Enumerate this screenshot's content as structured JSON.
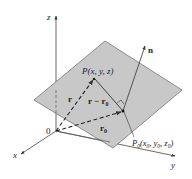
{
  "diagram": {
    "axes": {
      "x_label": "x",
      "y_label": "y",
      "z_label": "z",
      "origin_label": "0"
    },
    "points": {
      "P": {
        "name": "P",
        "coords": "(x, y, z)"
      },
      "P0": {
        "name": "P",
        "sub": "0",
        "coords_open": "(x",
        "coords_parts": [
          "0",
          ", y",
          "0",
          ", z",
          "0",
          ")"
        ]
      }
    },
    "vectors": {
      "r": "r",
      "r_minus_r0_main": "r − r",
      "r_minus_r0_sub": "0",
      "r0_main": "r",
      "r0_sub": "0",
      "n": "n"
    },
    "colors": {
      "plane_fill": "#c8c8c8",
      "plane_stroke": "#555555",
      "line": "#333333"
    }
  }
}
